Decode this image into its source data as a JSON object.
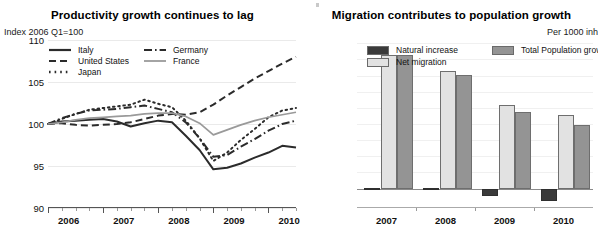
{
  "colors": {
    "natural_increase": "#3a3a3a",
    "net_migration": "#e2e2e2",
    "total_growth": "#949494",
    "italy": "#2b2b2b",
    "united_states": "#2b2b2b",
    "japan": "#2b2b2b",
    "germany": "#2b2b2b",
    "france": "#9a9a9a",
    "gridline": "#eaeaea",
    "axis": "#555555"
  },
  "left_panel": {
    "title": "Productivity growth continues to lag",
    "axis_note": "Index 2006 Q1=100",
    "legend": [
      {
        "label": "Italy",
        "style": "solid",
        "color": "#2b2b2b",
        "width": 2.1
      },
      {
        "label": "United States",
        "style": "dashed",
        "color": "#2b2b2b",
        "width": 2.1
      },
      {
        "label": "Japan",
        "style": "dotted",
        "color": "#2b2b2b",
        "width": 2.1
      },
      {
        "label": "Germany",
        "style": "dashdot",
        "color": "#2b2b2b",
        "width": 2.1
      },
      {
        "label": "France",
        "style": "solid",
        "color": "#9a9a9a",
        "width": 1.6
      }
    ]
  },
  "right_panel": {
    "title": "Migration contributes to population growth",
    "axis_note": "Per 1000 inh",
    "legend": [
      {
        "label": "Natural increase",
        "color": "#3a3a3a"
      },
      {
        "label": "Net migration",
        "color": "#e2e2e2"
      },
      {
        "label": "Total Population growth",
        "color": "#949494"
      }
    ]
  },
  "chart_data": [
    {
      "type": "line",
      "title": "Productivity growth continues to lag",
      "xlabel": "",
      "ylabel": "Index 2006 Q1=100",
      "ylim": [
        90,
        110
      ],
      "yticks": [
        90,
        95,
        100,
        105,
        110
      ],
      "grid": true,
      "legend_position": "top-left",
      "x_tick_labels": [
        "2006",
        "2007",
        "2008",
        "2009",
        "2010"
      ],
      "x_minor_ticks_per_year": 4,
      "x": [
        "2006Q1",
        "2006Q2",
        "2006Q3",
        "2006Q4",
        "2007Q1",
        "2007Q2",
        "2007Q3",
        "2007Q4",
        "2008Q1",
        "2008Q2",
        "2008Q3",
        "2008Q4",
        "2009Q1",
        "2009Q2",
        "2009Q3",
        "2009Q4",
        "2010Q1",
        "2010Q2",
        "2010Q3"
      ],
      "series": [
        {
          "name": "Italy",
          "style": "solid",
          "color": "#2b2b2b",
          "values": [
            100.0,
            100.3,
            100.4,
            100.5,
            100.6,
            100.3,
            99.7,
            100.1,
            100.4,
            100.2,
            98.6,
            96.9,
            94.6,
            94.8,
            95.3,
            96.0,
            96.6,
            97.4,
            97.2
          ]
        },
        {
          "name": "United States",
          "style": "dashed",
          "color": "#2b2b2b",
          "values": [
            100.0,
            100.1,
            99.9,
            99.8,
            99.9,
            100.0,
            100.2,
            100.6,
            101.0,
            101.2,
            101.1,
            101.4,
            102.3,
            103.4,
            104.4,
            105.4,
            106.3,
            107.2,
            108.0
          ]
        },
        {
          "name": "Japan",
          "style": "dotted",
          "color": "#2b2b2b",
          "values": [
            100.0,
            100.6,
            101.2,
            101.7,
            101.9,
            102.1,
            102.3,
            102.9,
            102.4,
            102.0,
            100.4,
            98.3,
            95.6,
            96.6,
            98.1,
            99.4,
            100.8,
            101.6,
            101.9
          ]
        },
        {
          "name": "Germany",
          "style": "dashdot",
          "color": "#2b2b2b",
          "values": [
            100.0,
            100.7,
            101.2,
            101.6,
            101.7,
            101.8,
            102.0,
            102.2,
            101.8,
            101.4,
            100.2,
            98.3,
            96.1,
            96.3,
            97.3,
            98.2,
            99.2,
            100.0,
            100.4
          ]
        },
        {
          "name": "France",
          "style": "solid",
          "color": "#9a9a9a",
          "values": [
            100.0,
            100.2,
            100.5,
            100.7,
            100.8,
            100.9,
            101.0,
            101.2,
            101.3,
            101.3,
            100.9,
            100.1,
            98.7,
            99.3,
            99.9,
            100.4,
            100.8,
            101.1,
            101.4
          ]
        }
      ]
    },
    {
      "type": "bar",
      "title": "Migration contributes to population growth",
      "xlabel": "",
      "ylabel": "Per 1000 inh",
      "grid": true,
      "legend_position": "top",
      "categories": [
        "2007",
        "2008",
        "2009",
        "2010"
      ],
      "ylim": [
        -1.2,
        9.2
      ],
      "series": [
        {
          "name": "Natural increase",
          "color": "#3a3a3a",
          "values": [
            0.05,
            0.05,
            -0.45,
            -0.75
          ]
        },
        {
          "name": "Net migration",
          "color": "#e2e2e2",
          "values": [
            8.3,
            7.3,
            5.2,
            4.55
          ]
        },
        {
          "name": "Total Population growth",
          "color": "#949494",
          "values": [
            8.25,
            7.05,
            4.75,
            3.95
          ]
        }
      ]
    }
  ]
}
